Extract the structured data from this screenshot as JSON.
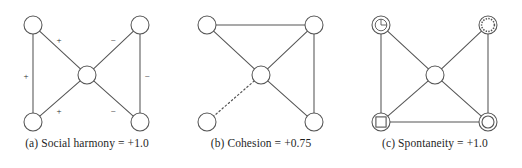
{
  "figure": {
    "background_color": "#ffffff",
    "stroke_color": "#555555",
    "node_fill": "#ffffff",
    "text_color": "#1f1f1f",
    "panel_count": 3
  },
  "panels": [
    {
      "id": "panel-a",
      "caption": "(a) Social harmony = +1.0",
      "metric_name": "Social harmony",
      "metric_value": "+1.0",
      "graph_type": "signed-bowtie",
      "nodes": [
        {
          "name": "top-left",
          "cx": 33,
          "cy": 25,
          "r": 9,
          "marker": "plain"
        },
        {
          "name": "top-right",
          "cx": 140,
          "cy": 25,
          "r": 9,
          "marker": "plain"
        },
        {
          "name": "center",
          "cx": 87,
          "cy": 75,
          "r": 9,
          "marker": "plain"
        },
        {
          "name": "bottom-left",
          "cx": 33,
          "cy": 122,
          "r": 9,
          "marker": "plain"
        },
        {
          "name": "bottom-right",
          "cx": 140,
          "cy": 122,
          "r": 9,
          "marker": "plain"
        }
      ],
      "edges": [
        {
          "from": "top-left",
          "to": "bottom-left",
          "style": "solid",
          "sign": "+",
          "label_x": 26,
          "label_y": 77
        },
        {
          "from": "top-left",
          "to": "center",
          "style": "solid",
          "sign": "+",
          "label_x": 59,
          "label_y": 41
        },
        {
          "from": "bottom-left",
          "to": "center",
          "style": "solid",
          "sign": "+",
          "label_x": 59,
          "label_y": 112
        },
        {
          "from": "top-right",
          "to": "bottom-right",
          "style": "solid",
          "sign": "−",
          "label_x": 147,
          "label_y": 77
        },
        {
          "from": "top-right",
          "to": "center",
          "style": "solid",
          "sign": "−",
          "label_x": 113,
          "label_y": 41
        },
        {
          "from": "bottom-right",
          "to": "center",
          "style": "solid",
          "sign": "−",
          "label_x": 113,
          "label_y": 112
        }
      ]
    },
    {
      "id": "panel-b",
      "caption": "(b) Cohesion = +0.75",
      "metric_name": "Cohesion",
      "metric_value": "+0.75",
      "graph_type": "mixed-solid-dashed",
      "nodes": [
        {
          "name": "top-left",
          "cx": 33,
          "cy": 25,
          "r": 9,
          "marker": "plain"
        },
        {
          "name": "top-right",
          "cx": 140,
          "cy": 25,
          "r": 9,
          "marker": "plain"
        },
        {
          "name": "center",
          "cx": 87,
          "cy": 75,
          "r": 9,
          "marker": "plain"
        },
        {
          "name": "bottom-left",
          "cx": 33,
          "cy": 122,
          "r": 9,
          "marker": "plain"
        },
        {
          "name": "bottom-right",
          "cx": 140,
          "cy": 122,
          "r": 9,
          "marker": "plain"
        }
      ],
      "edges": [
        {
          "from": "top-left",
          "to": "top-right",
          "style": "solid",
          "sign": "",
          "label_x": 0,
          "label_y": 0
        },
        {
          "from": "top-left",
          "to": "center",
          "style": "solid",
          "sign": "",
          "label_x": 0,
          "label_y": 0
        },
        {
          "from": "top-right",
          "to": "center",
          "style": "solid",
          "sign": "",
          "label_x": 0,
          "label_y": 0
        },
        {
          "from": "top-right",
          "to": "bottom-right",
          "style": "solid",
          "sign": "",
          "label_x": 0,
          "label_y": 0
        },
        {
          "from": "center",
          "to": "bottom-right",
          "style": "solid",
          "sign": "",
          "label_x": 0,
          "label_y": 0
        },
        {
          "from": "center",
          "to": "bottom-left",
          "style": "dashed",
          "sign": "",
          "label_x": 0,
          "label_y": 0
        }
      ]
    },
    {
      "id": "panel-c",
      "caption": "(c) Spontaneity = +1.0",
      "metric_name": "Spontaneity",
      "metric_value": "+1.0",
      "graph_type": "marked-nodes",
      "nodes": [
        {
          "name": "top-left",
          "cx": 33,
          "cy": 25,
          "r": 9,
          "marker": "clock"
        },
        {
          "name": "top-right",
          "cx": 140,
          "cy": 25,
          "r": 9,
          "marker": "dotted-circle"
        },
        {
          "name": "center",
          "cx": 87,
          "cy": 75,
          "r": 9,
          "marker": "plain"
        },
        {
          "name": "bottom-left",
          "cx": 33,
          "cy": 122,
          "r": 9,
          "marker": "square"
        },
        {
          "name": "bottom-right",
          "cx": 140,
          "cy": 122,
          "r": 9,
          "marker": "double-circle"
        }
      ],
      "edges": [
        {
          "from": "top-left",
          "to": "bottom-left",
          "style": "solid",
          "sign": "",
          "label_x": 0,
          "label_y": 0
        },
        {
          "from": "top-right",
          "to": "bottom-right",
          "style": "solid",
          "sign": "",
          "label_x": 0,
          "label_y": 0
        },
        {
          "from": "bottom-left",
          "to": "bottom-right",
          "style": "solid",
          "sign": "",
          "label_x": 0,
          "label_y": 0
        },
        {
          "from": "top-left",
          "to": "center",
          "style": "solid",
          "sign": "",
          "label_x": 0,
          "label_y": 0
        },
        {
          "from": "top-right",
          "to": "center",
          "style": "solid",
          "sign": "",
          "label_x": 0,
          "label_y": 0
        },
        {
          "from": "bottom-left",
          "to": "center",
          "style": "solid",
          "sign": "",
          "label_x": 0,
          "label_y": 0
        },
        {
          "from": "bottom-right",
          "to": "center",
          "style": "solid",
          "sign": "",
          "label_x": 0,
          "label_y": 0
        }
      ]
    }
  ]
}
